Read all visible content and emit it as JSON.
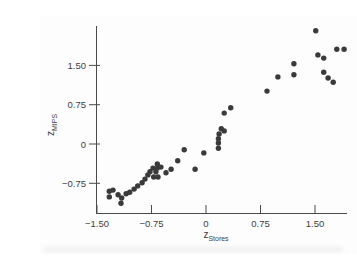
{
  "figure": {
    "background": "#fdfdfd",
    "point_color": "#3a3a3a",
    "axis_color": "#4a4a4a",
    "label_color": "#3d3d3d"
  },
  "chart_data": {
    "type": "scatter",
    "title": "",
    "xlabel": "z_Stores",
    "ylabel": "z_MIPS",
    "xlabel_base": "z",
    "xlabel_sub": "Stores",
    "ylabel_base": "z",
    "ylabel_sub": "MIPS",
    "xlim": [
      -1.55,
      1.95
    ],
    "ylim": [
      -1.32,
      2.25
    ],
    "grid": false,
    "legend": "none",
    "x_ticks": [
      {
        "value": -1.5,
        "label": "−1.50"
      },
      {
        "value": -0.75,
        "label": "−0.75"
      },
      {
        "value": 0,
        "label": "0"
      },
      {
        "value": 0.75,
        "label": "0.75"
      },
      {
        "value": 1.5,
        "label": "1.50"
      }
    ],
    "y_ticks": [
      {
        "value": 1.5,
        "label": "1.50"
      },
      {
        "value": 0.75,
        "label": "0.75"
      },
      {
        "value": 0,
        "label": "0"
      },
      {
        "value": -0.75,
        "label": "−0.75"
      }
    ],
    "points": [
      [
        -1.33,
        -0.9
      ],
      [
        -1.28,
        -0.88
      ],
      [
        -1.33,
        -1.01
      ],
      [
        -1.21,
        -0.97
      ],
      [
        -1.16,
        -1.03
      ],
      [
        -1.1,
        -0.95
      ],
      [
        -1.17,
        -1.13
      ],
      [
        -1.05,
        -0.92
      ],
      [
        -0.99,
        -0.86
      ],
      [
        -0.94,
        -0.8
      ],
      [
        -0.88,
        -0.74
      ],
      [
        -0.84,
        -0.67
      ],
      [
        -0.8,
        -0.59
      ],
      [
        -0.77,
        -0.53
      ],
      [
        -0.73,
        -0.46
      ],
      [
        -0.67,
        -0.38
      ],
      [
        -0.67,
        -0.46
      ],
      [
        -0.62,
        -0.44
      ],
      [
        -0.69,
        -0.53
      ],
      [
        -0.72,
        -0.63
      ],
      [
        -0.66,
        -0.63
      ],
      [
        -0.55,
        -0.55
      ],
      [
        -0.48,
        -0.48
      ],
      [
        -0.39,
        -0.32
      ],
      [
        -0.3,
        -0.11
      ],
      [
        -0.15,
        -0.48
      ],
      [
        -0.03,
        -0.17
      ],
      [
        0.17,
        -0.08
      ],
      [
        0.17,
        0.02
      ],
      [
        0.17,
        0.1
      ],
      [
        0.18,
        0.19
      ],
      [
        0.21,
        0.29
      ],
      [
        0.25,
        0.25
      ],
      [
        0.25,
        0.59
      ],
      [
        0.34,
        0.69
      ],
      [
        0.84,
        1.01
      ],
      [
        0.99,
        1.28
      ],
      [
        1.21,
        1.53
      ],
      [
        1.21,
        1.32
      ],
      [
        1.51,
        2.16
      ],
      [
        1.54,
        1.7
      ],
      [
        1.62,
        1.64
      ],
      [
        1.8,
        1.81
      ],
      [
        1.9,
        1.81
      ],
      [
        1.62,
        1.37
      ],
      [
        1.68,
        1.26
      ],
      [
        1.75,
        1.18
      ]
    ]
  }
}
